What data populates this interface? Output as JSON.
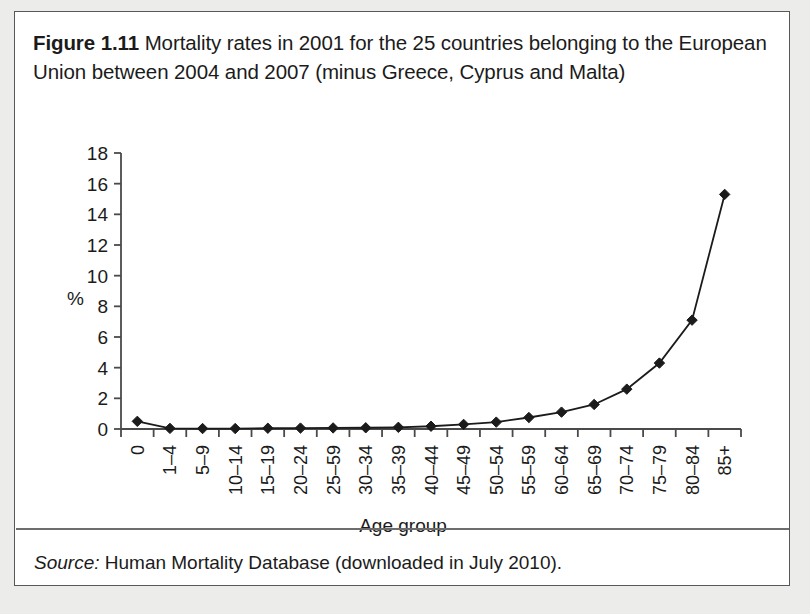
{
  "figure": {
    "label": "Figure 1.11",
    "caption": "Mortality rates in 2001 for the 25 countries belonging to the European Union between 2004 and 2007 (minus Greece, Cyprus and Malta)"
  },
  "source": {
    "label": "Source:",
    "text": "Human Mortality Database (downloaded in July 2010)."
  },
  "chart_data": {
    "type": "line",
    "title": "",
    "xlabel": "Age group",
    "ylabel": "%",
    "ylim": [
      0,
      18
    ],
    "yticks": [
      0,
      2,
      4,
      6,
      8,
      10,
      12,
      14,
      16,
      18
    ],
    "grid": false,
    "legend": "none",
    "marker": "diamond",
    "line_color": "#1b1b1b",
    "marker_color": "#1b1b1b",
    "categories": [
      "0",
      "1–4",
      "5–9",
      "10–14",
      "15–19",
      "20–24",
      "25–59",
      "30–34",
      "35–39",
      "40–44",
      "45–49",
      "50–54",
      "55–59",
      "60–64",
      "65–69",
      "70–74",
      "75–79",
      "80–84",
      "85+"
    ],
    "values": [
      0.5,
      0.04,
      0.03,
      0.03,
      0.05,
      0.06,
      0.07,
      0.08,
      0.11,
      0.18,
      0.3,
      0.45,
      0.75,
      1.1,
      1.6,
      2.6,
      4.3,
      7.1,
      15.3
    ]
  }
}
